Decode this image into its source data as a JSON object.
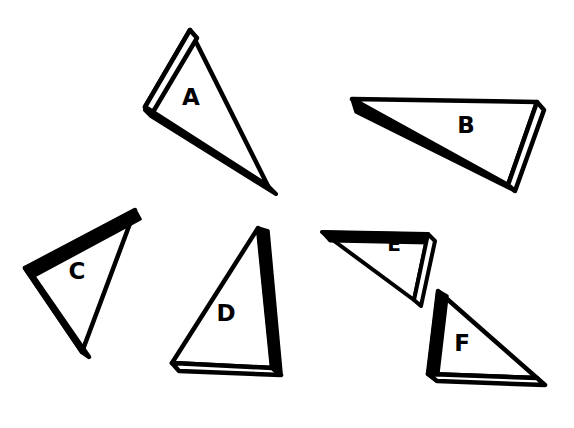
{
  "figure": {
    "width": 574,
    "height": 428,
    "background_color": "#ffffff",
    "ink_color": "#000000",
    "rim_color": "#ffffff"
  },
  "style": {
    "outline_width": 4,
    "label_font_size": 23,
    "slab_fill": "#000000",
    "face_fill": "#ffffff"
  },
  "shapes": [
    {
      "id": "shape-a",
      "label": "A",
      "label_x": 191,
      "label_y": 98,
      "shaded_edge": "bottom-left",
      "rim_edge": "left",
      "face": "190,30 145,107 268,186",
      "slab": "145,107 190,30 196,37 152,110 275,192 268,186",
      "rim": "154,106 192,40 197,44 160,107"
    },
    {
      "id": "shape-b",
      "label": "B",
      "label_x": 466,
      "label_y": 126,
      "shaded_edge": "top-and-lower-left",
      "rim_edge": "right",
      "face": "352,99 537,102 508,185",
      "slab": "352,99 537,102 537,110 360,107 515,190 508,185",
      "rim": "530,109 537,110 515,190 508,185"
    },
    {
      "id": "shape-c",
      "label": "C",
      "label_x": 77,
      "label_y": 272,
      "shaded_edge": "top",
      "rim_edge": "bottom-left",
      "face": "135,210 25,268 82,352",
      "slab": "135,210 25,268 33,274 139,218",
      "rim": "25,268 33,275 88,356 82,352"
    },
    {
      "id": "shape-d",
      "label": "D",
      "label_x": 226,
      "label_y": 314,
      "shaded_edge": "right",
      "rim_edge": "bottom",
      "face": "258,228 172,363 272,368",
      "slab": "258,228 266,231 280,372 272,368",
      "rim": "172,363 272,368 280,374 179,370"
    },
    {
      "id": "shape-e",
      "label": "E",
      "label_x": 394,
      "label_y": 245,
      "shaded_edge": "top",
      "rim_edge": "right",
      "face": "322,232 428,234 414,300",
      "slab": "322,232 428,234 428,242 330,240",
      "rim": "421,241 428,242 421,305 414,300"
    },
    {
      "id": "shape-f",
      "label": "F",
      "label_x": 462,
      "label_y": 344,
      "shaded_edge": "left",
      "rim_edge": "bottom",
      "face": "438,291 537,378 428,374"
    }
  ],
  "shapes_extra": {
    "shape-f": {
      "slab": "438,291 428,374 436,380 446,295",
      "rim": "428,374 537,378 544,384 436,380"
    }
  },
  "labels_list": [
    "A",
    "B",
    "C",
    "D",
    "E",
    "F"
  ]
}
